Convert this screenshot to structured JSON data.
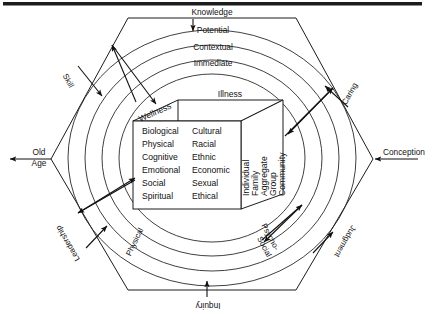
{
  "diagram": {
    "title_visible": false,
    "type": "nested hexagon and concentric rings model with central cube",
    "axis_endpoints": {
      "left": "Old\nAge",
      "left_line1": "Old",
      "left_line2": "Age",
      "right": "Conception"
    },
    "hexagon_edges": {
      "top": "Knowledge",
      "upper_left": "Skill",
      "upper_right": "Caring",
      "lower_left": "Leadership",
      "lower_right": "Judgment",
      "bottom": "Inquiry"
    },
    "rings": [
      {
        "name": "Potential",
        "position": "top",
        "order": 1
      },
      {
        "name": "Contextual",
        "position": "top",
        "order": 2
      },
      {
        "name": "Immediate",
        "position": "top",
        "order": 3
      },
      {
        "name": "Physical",
        "position": "lower-left-arc",
        "order": 4
      },
      {
        "name": "Psycho-",
        "position": "lower-right-arc",
        "order": 5
      },
      {
        "name": "Social",
        "position": "lower-right-arc",
        "order": 6
      }
    ],
    "cube": {
      "top_left_label": "Wellness",
      "top_label": "Illness",
      "front_column_1": [
        "Biological",
        "Physical",
        "Cognitive",
        "Emotional",
        "Social",
        "Spiritual"
      ],
      "front_column_2": [
        "Cultural",
        "Racial",
        "Ethnic",
        "Economic",
        "Sexual",
        "Ethical"
      ],
      "side_labels": [
        "Individual",
        "Family",
        "Aggregate",
        "Group",
        "Community"
      ]
    },
    "colors": {
      "ink": "#1b1b1b",
      "background": "#ffffff",
      "top_bar": "#1c1c1c"
    }
  }
}
